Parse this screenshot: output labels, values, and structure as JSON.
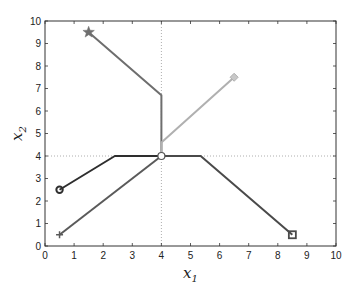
{
  "chart_data": {
    "type": "line",
    "title": "",
    "xlabel": "x1",
    "ylabel": "x2",
    "xlim": [
      0,
      10
    ],
    "ylim": [
      0,
      10
    ],
    "xticks": [
      0,
      1,
      2,
      3,
      4,
      5,
      6,
      7,
      8,
      9,
      10
    ],
    "yticks": [
      0,
      1,
      2,
      3,
      4,
      5,
      6,
      7,
      8,
      9,
      10
    ],
    "grid": false,
    "reference_lines": [
      {
        "orientation": "vertical",
        "x": 4,
        "style": "dotted"
      },
      {
        "orientation": "horizontal",
        "y": 4,
        "style": "dotted"
      }
    ],
    "series": [
      {
        "name": "star-path",
        "marker": "star",
        "color": "#6e6e6e",
        "points": [
          [
            1.5,
            9.5
          ],
          [
            4,
            6.7
          ],
          [
            4,
            4
          ]
        ]
      },
      {
        "name": "diamond-path",
        "marker": "diamond",
        "color": "#b0b0b0",
        "points": [
          [
            6.5,
            7.5
          ],
          [
            4,
            4.6
          ],
          [
            4,
            4
          ]
        ]
      },
      {
        "name": "circle-path",
        "marker": "circle",
        "color": "#2e2e2e",
        "points": [
          [
            0.5,
            2.5
          ],
          [
            2.4,
            4
          ],
          [
            4,
            4
          ]
        ]
      },
      {
        "name": "square-path",
        "marker": "square",
        "color": "#4a4a4a",
        "points": [
          [
            8.5,
            0.5
          ],
          [
            5.35,
            4
          ],
          [
            4,
            4
          ]
        ]
      },
      {
        "name": "plus-path",
        "marker": "plus",
        "color": "#5a5a5a",
        "points": [
          [
            0.5,
            0.5
          ],
          [
            4,
            4
          ]
        ]
      }
    ],
    "annotations": [
      {
        "type": "open-circle",
        "x": 4,
        "y": 4
      }
    ]
  },
  "labels": {
    "xlabel_main": "x",
    "xlabel_sub": "1",
    "ylabel_main": "x",
    "ylabel_sub": "2"
  }
}
